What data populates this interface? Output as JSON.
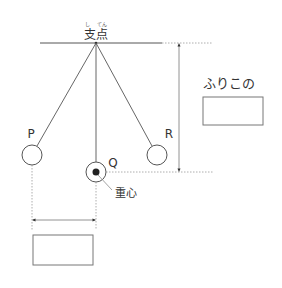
{
  "diagram": {
    "title": "ふりこ",
    "pivot": {
      "label": "支点",
      "furigana_left": "し",
      "furigana_right": "てん"
    },
    "bobs": [
      {
        "id": "P",
        "label": "P"
      },
      {
        "id": "Q",
        "label": "Q"
      },
      {
        "id": "R",
        "label": "R"
      }
    ],
    "center_of_gravity_label": "重心",
    "length_prompt_label": "ふりこの",
    "answer_boxes": {
      "right_box_value": "",
      "bottom_box_value": ""
    },
    "colors": {
      "line": "#555555",
      "dotted": "#999999",
      "text": "#333333",
      "box_border": "#777777"
    }
  }
}
